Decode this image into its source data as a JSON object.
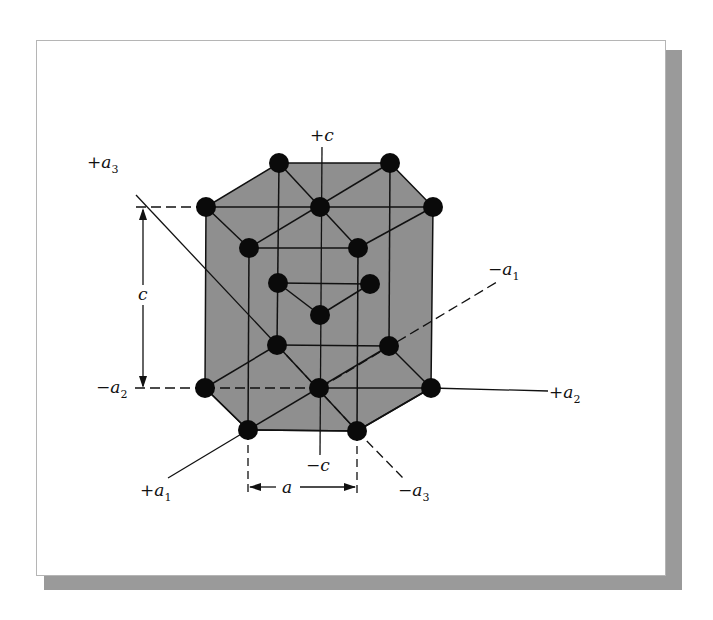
{
  "figure": {
    "colors": {
      "cell_fill": "#8f8f8f",
      "atom": "#0a0a0a",
      "line": "#111111",
      "shadow": "#9a9a9a"
    }
  },
  "axes": {
    "plus_c": {
      "sign": "+",
      "sym": "c",
      "sub": ""
    },
    "minus_c": {
      "sign": "−",
      "sym": "c",
      "sub": ""
    },
    "plus_a1": {
      "sign": "+",
      "sym": "a",
      "sub": "1"
    },
    "minus_a1": {
      "sign": "−",
      "sym": "a",
      "sub": "1"
    },
    "plus_a2": {
      "sign": "+",
      "sym": "a",
      "sub": "2"
    },
    "minus_a2": {
      "sign": "−",
      "sym": "a",
      "sub": "2"
    },
    "plus_a3": {
      "sign": "+",
      "sym": "a",
      "sub": "3"
    },
    "minus_a3": {
      "sign": "−",
      "sym": "a",
      "sub": "3"
    }
  },
  "dimensions": {
    "height_label": "c",
    "width_label": "a"
  }
}
